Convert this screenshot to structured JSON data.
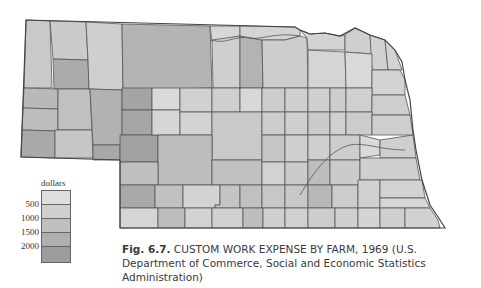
{
  "map": {
    "title": "Nebraska counties - custom work expense by farm",
    "colors": {
      "class1": "#dcdcdc",
      "class2": "#cdcdcd",
      "class3": "#bdbdbd",
      "class4": "#acacac",
      "class5": "#9a9a9a",
      "border": "#555555"
    }
  },
  "legend": {
    "title": "dollars",
    "ticks": [
      "500",
      "1000",
      "1500",
      "2000"
    ],
    "swatches": [
      "#dedede",
      "#cfcfcf",
      "#bfbfbf",
      "#afafaf",
      "#9d9d9d"
    ]
  },
  "caption": {
    "fig_label": "Fig. 6.7.",
    "text": " CUSTOM WORK EXPENSE BY FARM, 1969 (U.S. Department of Commerce, Social and Economic Statistics Administration)"
  }
}
